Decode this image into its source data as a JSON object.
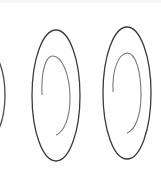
{
  "image": {
    "description": "Three spiral-in-ellipse drawings (left one cropped)",
    "colors": {
      "background": "#ffffff",
      "outer_stroke": "#3a3a3a",
      "inner_stroke": "#7a7a7a"
    },
    "shapes": [
      {
        "name": "left-spiral-partial",
        "visible": "right edge only"
      },
      {
        "name": "middle-spiral"
      },
      {
        "name": "right-spiral"
      }
    ]
  }
}
